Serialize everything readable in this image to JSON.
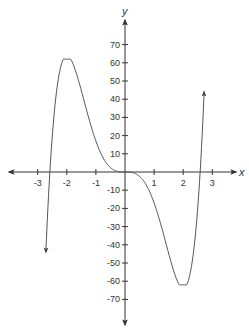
{
  "chart_data": {
    "type": "line",
    "title": "",
    "xlabel": "x",
    "ylabel": "y",
    "xlim": [
      -4.1,
      3.9
    ],
    "ylim": [
      -84,
      84
    ],
    "x_ticks": [
      -3,
      -2,
      -1,
      1,
      2,
      3
    ],
    "x_tick_labels": [
      "-3",
      "-2",
      "-1",
      "1",
      "2",
      "3"
    ],
    "y_ticks": [
      70,
      60,
      50,
      40,
      30,
      20,
      10,
      -10,
      -20,
      -30,
      -40,
      -50,
      -60,
      -70
    ],
    "y_tick_labels": [
      "70",
      "60",
      "50",
      "40",
      "30",
      "20",
      "10",
      "-10",
      "-20",
      "-30",
      "-40",
      "-50",
      "-60",
      "-70"
    ],
    "grid": false,
    "legend": null,
    "series": [
      {
        "name": "f(x)",
        "description": "Quintic curve approx. 3x^5 - 20x^3 with arrows at both ends",
        "x": [
          -2.72,
          -2.6,
          -2.5,
          -2.4,
          -2.2,
          -2.0,
          -1.8,
          -1.6,
          -1.4,
          -1.2,
          -1.0,
          -0.8,
          -0.6,
          -0.4,
          -0.2,
          0,
          0.2,
          0.4,
          0.6,
          0.8,
          1.0,
          1.2,
          1.4,
          1.6,
          1.8,
          2.0,
          2.2,
          2.4,
          2.5,
          2.6,
          2.72
        ],
        "values": [
          -57,
          -1,
          23,
          40,
          59,
          64,
          59,
          48,
          38,
          27,
          17,
          9,
          4,
          1,
          0,
          0,
          0,
          -1,
          -4,
          -9,
          -17,
          -27,
          -38,
          -48,
          -59,
          -64,
          -59,
          -40,
          -23,
          1,
          57
        ],
        "color": "#555555",
        "arrows": "both-ends"
      }
    ],
    "key_points": {
      "local_max": [
        -2,
        64
      ],
      "local_min": [
        2,
        -64
      ],
      "inflection": [
        0,
        0
      ],
      "x_intercepts": [
        -2.58,
        0,
        2.58
      ]
    }
  },
  "axes": {
    "x_label": "x",
    "y_label": "y",
    "color": "#333333"
  }
}
